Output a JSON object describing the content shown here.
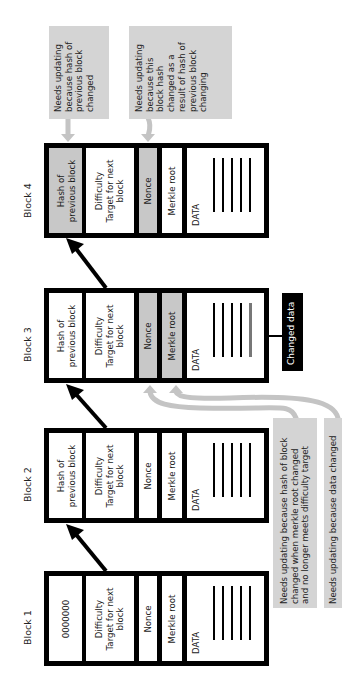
{
  "diagram": {
    "orientation": "rotated 90deg counter-clockwise",
    "colors": {
      "block_border": "#000000",
      "highlight_fill": "#c8c8c8",
      "note_fill": "#d4d4d4",
      "arrow_gray": "#c8c8c8",
      "changed_label_bg": "#000000"
    },
    "blocks": [
      {
        "label": "Block 1",
        "fields": {
          "hash": "0000000",
          "difficulty_title": "Difficulty",
          "difficulty_sub": "Target for next",
          "difficulty_sub2": "block",
          "nonce": "Nonce",
          "merkle": "Merkle root",
          "data": "DATA"
        },
        "highlighted": []
      },
      {
        "label": "Block 2",
        "fields": {
          "hash_line1": "Hash of",
          "hash_line2": "previous block",
          "difficulty_title": "Difficulty",
          "difficulty_sub": "Target for next",
          "difficulty_sub2": "block",
          "nonce": "Nonce",
          "merkle": "Merkle root",
          "data": "DATA"
        },
        "highlighted": []
      },
      {
        "label": "Block 3",
        "fields": {
          "hash_line1": "Hash of",
          "hash_line2": "previous block",
          "difficulty_title": "Difficulty",
          "difficulty_sub": "Target for next",
          "difficulty_sub2": "block",
          "nonce": "Nonce",
          "merkle": "Merkle root",
          "data": "DATA"
        },
        "highlighted": [
          "nonce",
          "merkle"
        ]
      },
      {
        "label": "Block 4",
        "fields": {
          "hash_line1": "Hash of",
          "hash_line2": "previous block",
          "difficulty_title": "Difficulty",
          "difficulty_sub": "Target for next",
          "difficulty_sub2": "block",
          "nonce": "Nonce",
          "merkle": "Merkle root",
          "data": "DATA"
        },
        "highlighted": [
          "hash",
          "nonce"
        ]
      }
    ],
    "changed_data_label": "Changed data",
    "notes": {
      "block4_hash": [
        "Needs updating",
        "because hash of",
        "previous block",
        "changed"
      ],
      "block4_nonce": [
        "Needs updating",
        "because this",
        "block hash",
        "changed as a",
        "result of hash of",
        "previous block",
        "changing"
      ],
      "block3_nonce": [
        "Needs updating because hash of block",
        "changed when merkle root changed",
        "and no longer meets difficulty target"
      ],
      "block3_merkle": [
        "Needs updating because data changed"
      ]
    }
  }
}
